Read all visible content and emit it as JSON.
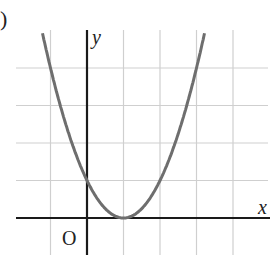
{
  "panel_label": ")",
  "chart_data": {
    "type": "line",
    "title": "",
    "xlabel": "x",
    "ylabel": "y",
    "origin_label": "O",
    "function": "y = (x - 1)^2",
    "grid": true,
    "xlim": [
      -1.9,
      4.9
    ],
    "ylim": [
      -1.1,
      5.1
    ],
    "grid_x": [
      -1,
      1,
      2,
      3,
      4
    ],
    "grid_y": [
      1,
      2,
      3,
      4
    ],
    "x": [
      -1.3,
      -1,
      -0.5,
      0,
      0.5,
      1,
      1.5,
      2,
      2.5,
      3,
      3.2
    ],
    "values": [
      5.29,
      4,
      2.25,
      1,
      0.25,
      0,
      0.25,
      1,
      2.25,
      4,
      4.84
    ],
    "vertex": [
      1,
      0
    ],
    "y_intercept": 1,
    "colors": {
      "curve": "#6e6e6e",
      "axes": "#1a1a1a",
      "grid": "#cfcfcf"
    }
  }
}
